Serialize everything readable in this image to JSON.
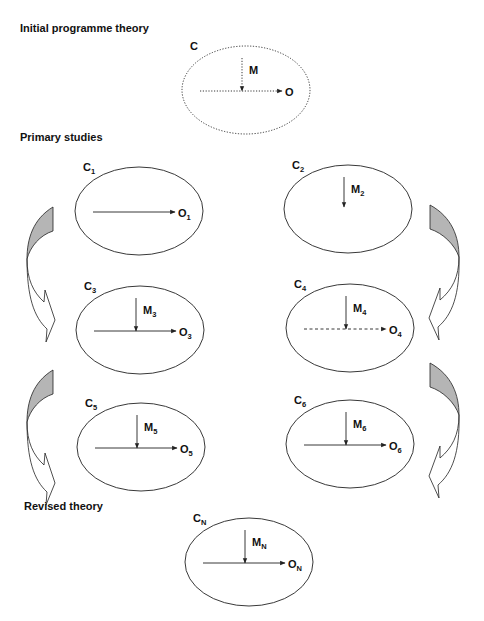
{
  "sections": {
    "initial": "Initial programme theory",
    "primary": "Primary studies",
    "revised": "Revised theory"
  },
  "nodes": [
    {
      "id": "initial",
      "context": "C",
      "context_sub": "",
      "mechanism": "M",
      "mechanism_sub": "",
      "outcome": "O",
      "outcome_sub": "",
      "has_mechanism": true,
      "has_outcome": true,
      "ellipse_style": "dotted",
      "outcome_line_style": "dotted",
      "mechanism_line_style": "dotted"
    },
    {
      "id": "study1",
      "context": "C",
      "context_sub": "1",
      "mechanism": "",
      "mechanism_sub": "",
      "outcome": "O",
      "outcome_sub": "1",
      "has_mechanism": false,
      "has_outcome": true,
      "ellipse_style": "solid",
      "outcome_line_style": "solid",
      "mechanism_line_style": "solid"
    },
    {
      "id": "study2",
      "context": "C",
      "context_sub": "2",
      "mechanism": "M",
      "mechanism_sub": "2",
      "outcome": "",
      "outcome_sub": "",
      "has_mechanism": true,
      "has_outcome": false,
      "ellipse_style": "solid",
      "outcome_line_style": "solid",
      "mechanism_line_style": "solid"
    },
    {
      "id": "study3",
      "context": "C",
      "context_sub": "3",
      "mechanism": "M",
      "mechanism_sub": "3",
      "outcome": "O",
      "outcome_sub": "3",
      "has_mechanism": true,
      "has_outcome": true,
      "ellipse_style": "solid",
      "outcome_line_style": "solid",
      "mechanism_line_style": "solid"
    },
    {
      "id": "study4",
      "context": "C",
      "context_sub": "4",
      "mechanism": "M",
      "mechanism_sub": "4",
      "outcome": "O",
      "outcome_sub": "4",
      "has_mechanism": true,
      "has_outcome": true,
      "ellipse_style": "solid",
      "outcome_line_style": "dashed",
      "mechanism_line_style": "solid"
    },
    {
      "id": "study5",
      "context": "C",
      "context_sub": "5",
      "mechanism": "M",
      "mechanism_sub": "5",
      "outcome": "O",
      "outcome_sub": "5",
      "has_mechanism": true,
      "has_outcome": true,
      "ellipse_style": "solid",
      "outcome_line_style": "solid",
      "mechanism_line_style": "solid"
    },
    {
      "id": "study6",
      "context": "C",
      "context_sub": "6",
      "mechanism": "M",
      "mechanism_sub": "6",
      "outcome": "O",
      "outcome_sub": "6",
      "has_mechanism": true,
      "has_outcome": true,
      "ellipse_style": "solid",
      "outcome_line_style": "solid",
      "mechanism_line_style": "solid"
    },
    {
      "id": "revised",
      "context": "C",
      "context_sub": "N",
      "mechanism": "M",
      "mechanism_sub": "N",
      "outcome": "O",
      "outcome_sub": "N",
      "has_mechanism": true,
      "has_outcome": true,
      "ellipse_style": "solid",
      "outcome_line_style": "solid",
      "mechanism_line_style": "solid"
    }
  ],
  "flow_arrows": [
    {
      "from": "study1",
      "to": "study3",
      "side": "left"
    },
    {
      "from": "study3",
      "to": "study5",
      "side": "left"
    },
    {
      "from": "study2",
      "to": "study4",
      "side": "right"
    },
    {
      "from": "study4",
      "to": "study6",
      "side": "right"
    }
  ],
  "colors": {
    "stroke": "#222222",
    "arrow_fill": "#b5b5b5",
    "background": "#ffffff"
  }
}
